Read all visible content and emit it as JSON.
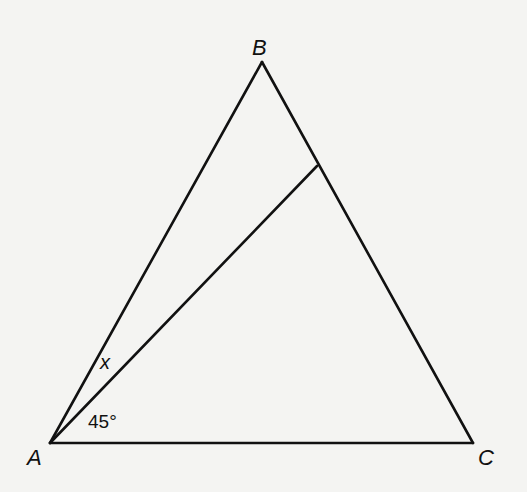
{
  "diagram": {
    "type": "triangle-with-cevian",
    "background": "#f4f4f2",
    "stroke_color": "#111111",
    "vertices": {
      "A": {
        "label": "A",
        "x": 50,
        "y": 443
      },
      "B": {
        "label": "B",
        "x": 262,
        "y": 62
      },
      "C": {
        "label": "C",
        "x": 473,
        "y": 443
      }
    },
    "cevian": {
      "from": "A",
      "to_point_on": "BC",
      "x": 317,
      "y": 166
    },
    "angle_labels": {
      "x": "x",
      "degrees": "45°"
    }
  }
}
